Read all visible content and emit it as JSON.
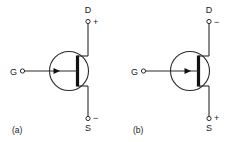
{
  "figure": {
    "type": "schematic-diagram",
    "background_color": "#ffffff",
    "line_color": "#2b2b2b",
    "channel_color": "#111111",
    "text_color": "#1a1a1a"
  },
  "panels": [
    {
      "id": "a",
      "caption": "(a)",
      "device": "n-channel-jfet",
      "terminals": {
        "drain": {
          "label": "D",
          "polarity": "+"
        },
        "source": {
          "label": "S",
          "polarity": "−"
        },
        "gate": {
          "label": "G",
          "polarity": ""
        }
      },
      "gate_arrow_direction": "pointing-in"
    },
    {
      "id": "b",
      "caption": "(b)",
      "device": "p-channel-jfet",
      "terminals": {
        "drain": {
          "label": "D",
          "polarity": "−"
        },
        "source": {
          "label": "S",
          "polarity": "+"
        },
        "gate": {
          "label": "G",
          "polarity": ""
        }
      },
      "gate_arrow_direction": "pointing-in"
    }
  ]
}
